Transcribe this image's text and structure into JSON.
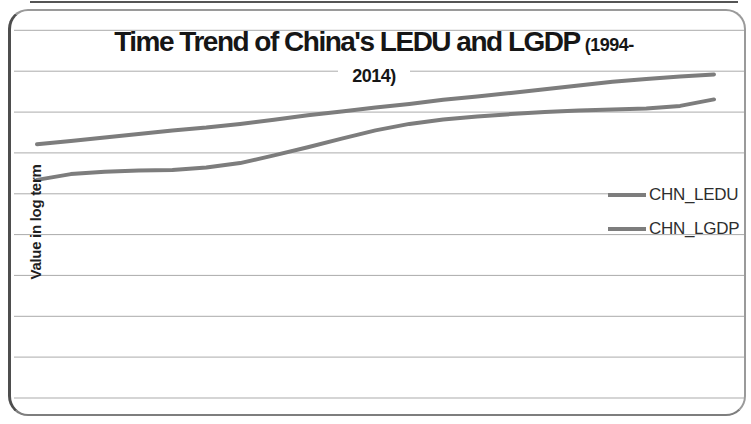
{
  "chart": {
    "title_main": "Time Trend of China's LEDU and LGDP",
    "title_suffix_line1": "(1994-",
    "title_suffix_line2": "2014)",
    "y_axis_label": "Value in log term",
    "colors": {
      "series_line": "#7d7d7d",
      "gridline": "#ababab",
      "title_text": "#161616",
      "frame_border": "#8a8a8a"
    }
  },
  "legend": {
    "items": [
      {
        "label": "CHN_LEDU"
      },
      {
        "label": "CHN_LGDP"
      }
    ]
  },
  "chart_data": {
    "type": "line",
    "xlabel": "",
    "ylabel": "Value in log term",
    "x": [
      1994,
      1995,
      1996,
      1997,
      1998,
      1999,
      2000,
      2001,
      2002,
      2003,
      2004,
      2005,
      2006,
      2007,
      2008,
      2009,
      2010,
      2011,
      2012,
      2013,
      2014
    ],
    "series": [
      {
        "name": "CHN_LEDU",
        "color": "#7d7d7d",
        "values": [
          5.34,
          5.48,
          5.54,
          5.57,
          5.58,
          5.64,
          5.75,
          5.94,
          6.14,
          6.35,
          6.55,
          6.71,
          6.82,
          6.89,
          6.95,
          7.0,
          7.04,
          7.06,
          7.09,
          7.15,
          7.31
        ]
      },
      {
        "name": "CHN_LGDP",
        "color": "#7d7d7d",
        "values": [
          6.21,
          6.29,
          6.38,
          6.46,
          6.55,
          6.62,
          6.71,
          6.81,
          6.92,
          7.01,
          7.11,
          7.2,
          7.3,
          7.38,
          7.47,
          7.56,
          7.65,
          7.74,
          7.81,
          7.87,
          7.92
        ]
      }
    ],
    "ylim": [
      0,
      9.7
    ],
    "xlim": [
      1994,
      2014
    ],
    "grid": "horizontal",
    "gridline_step": 1,
    "gridline_values": [
      0,
      1,
      2,
      3,
      4,
      5,
      6,
      7,
      8,
      9
    ],
    "y_tick_labels_visible": false,
    "x_tick_labels_visible": false,
    "legend_position": "right"
  }
}
